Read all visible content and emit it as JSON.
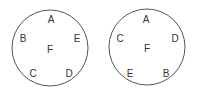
{
  "diagram": {
    "circles": [
      {
        "name": "left-circle",
        "labels": {
          "A": "A",
          "B": "B",
          "C": "C",
          "D": "D",
          "E": "E",
          "F": "F"
        }
      },
      {
        "name": "right-circle",
        "labels": {
          "A": "A",
          "B": "B",
          "C": "C",
          "D": "D",
          "E": "E",
          "F": "F"
        }
      }
    ]
  }
}
